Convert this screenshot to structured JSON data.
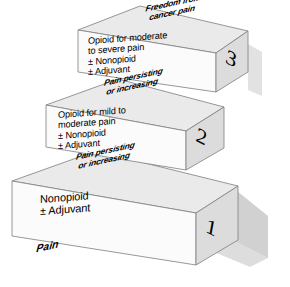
{
  "diagram": {
    "colors": {
      "top_face": "#e9e9e9",
      "front_face": "#fbfbfb",
      "side_face": "#d9d9d9",
      "outline": "#7a7a7a",
      "shadow": "#b9b9b9",
      "text": "#000000",
      "background": "#ffffff"
    },
    "goal_label": "Freedom from\ncancer pain",
    "base_label": "Pain",
    "steps": [
      {
        "number": "1",
        "front_text": "Nonopioid\n± Adjuvant",
        "top_text": "Pain persisting\nor increasing"
      },
      {
        "number": "2",
        "front_text": "Opioid for mild to\nmoderate pain\n± Nonopioid\n± Adjuvant",
        "top_text": "Pain persisting\nor increasing"
      },
      {
        "number": "3",
        "front_text": "Opioid for moderate\nto severe pain\n± Nonopioid\n± Adjuvant",
        "top_text": "Freedom from\ncancer pain"
      }
    ]
  }
}
